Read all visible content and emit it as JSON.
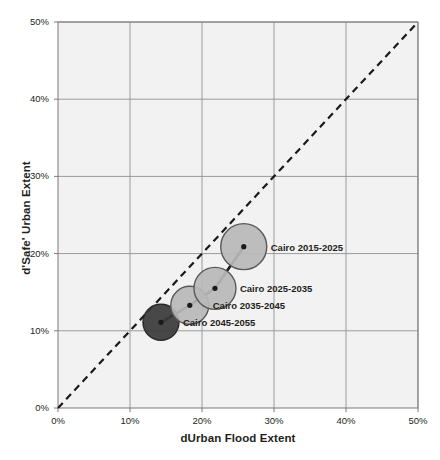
{
  "chart_data": {
    "type": "scatter",
    "title": "",
    "xlabel": "dUrban Flood Extent",
    "ylabel": "d'Safe' Urban Extent",
    "xlim": [
      0,
      50
    ],
    "ylim": [
      0,
      50
    ],
    "xticks": [
      "0%",
      "10%",
      "20%",
      "30%",
      "40%",
      "50%"
    ],
    "yticks": [
      "0%",
      "10%",
      "20%",
      "30%",
      "40%",
      "50%"
    ],
    "xtick_values": [
      0,
      10,
      20,
      30,
      40,
      50
    ],
    "ytick_values": [
      0,
      10,
      20,
      30,
      40,
      50
    ],
    "grid": true,
    "legend": "none",
    "series": [
      {
        "name": "Cairo",
        "points": [
          {
            "label": "Cairo 2015-2025",
            "x": 25.8,
            "y": 20.9,
            "size": 23,
            "fill": "#b8b8b8",
            "stroke": "#5a5a5a"
          },
          {
            "label": "Cairo 2025-2035",
            "x": 21.8,
            "y": 15.5,
            "size": 21,
            "fill": "#b8b8b8",
            "stroke": "#5a5a5a"
          },
          {
            "label": "Cairo 2035-2045",
            "x": 18.3,
            "y": 13.3,
            "size": 19,
            "fill": "#b8b8b8",
            "stroke": "#5a5a5a"
          },
          {
            "label": "Cairo 2045-2055",
            "x": 14.3,
            "y": 11.1,
            "size": 18,
            "fill": "#3a3a3a",
            "stroke": "#2a2a2a"
          }
        ]
      }
    ],
    "annotations": [
      {
        "name": "one-to-one-line",
        "style": "dashed",
        "from": [
          0,
          0
        ],
        "to": [
          50,
          50
        ],
        "color": "#1a1a1a"
      }
    ],
    "colors": {
      "plot_background": "#f2f2f2",
      "gridline": "#9a9a9a",
      "axis": "#7a7a7a",
      "text": "#231f20",
      "connector_line": "#1a1a1a"
    }
  }
}
